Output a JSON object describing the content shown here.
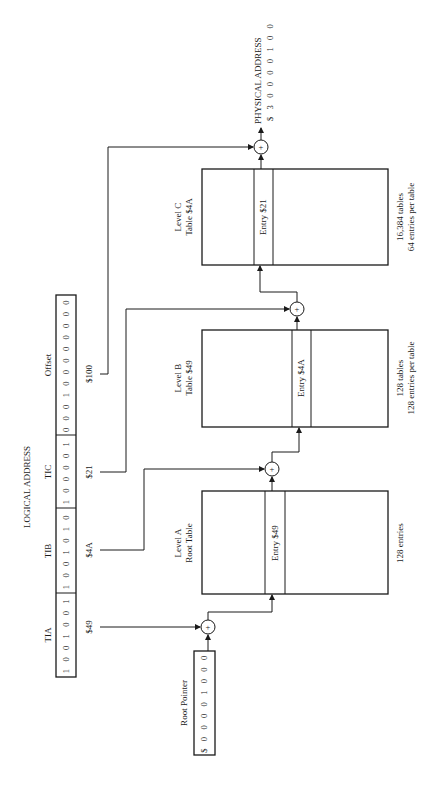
{
  "logical_address": {
    "title": "LOGICAL ADDRESS",
    "fields": [
      {
        "name": "TIA",
        "bits": "1 0 0 1 0 0 1",
        "value": "$49"
      },
      {
        "name": "TIB",
        "bits": "1 0 0 1 0 1 0",
        "value": "$4A"
      },
      {
        "name": "TIC",
        "bits": "1 0 0 0 0 1",
        "value": "$21"
      },
      {
        "name": "Offset",
        "bits": "0 0 0 1 0 0 0 0 0 0 0 0",
        "value": "$100"
      }
    ]
  },
  "root_pointer": {
    "label": "Root Pointer",
    "value": "$ 0 0 0 0 1 0 0 0"
  },
  "tables": [
    {
      "title_line1": "Level A",
      "title_line2": "Root Table",
      "entry": "Entry $49",
      "note_line1": "128 entries",
      "note_line2": ""
    },
    {
      "title_line1": "Level B",
      "title_line2": "Table $49",
      "entry": "Entry $4A",
      "note_line1": "128 tables",
      "note_line2": "128 entries per table"
    },
    {
      "title_line1": "Level C",
      "title_line2": "Table $4A",
      "entry": "Entry $21",
      "note_line1": "16,384 tables",
      "note_line2": "64 entries per table"
    }
  ],
  "adder_symbol": "+",
  "physical_address": {
    "title": "PHYSICAL ADDRESS",
    "value": "$ 3 0 0 0 0 1 0 0"
  }
}
